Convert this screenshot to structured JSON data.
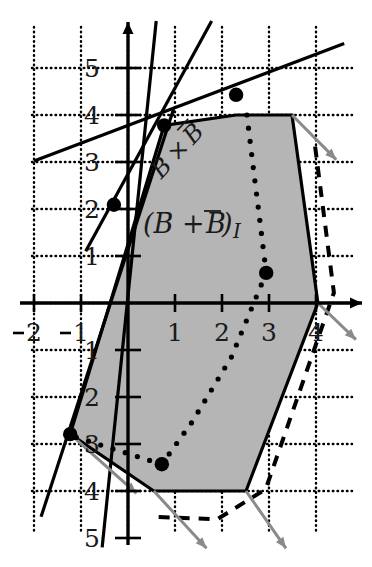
{
  "figure": {
    "title_label": "(B + B̅)₁",
    "region_label_main": "(B + ",
    "region_label_bar": "B",
    "region_label_close": ")",
    "region_label_sub": "I",
    "minkowski_label": "B × B",
    "minkowski_label_parts": {
      "b1": "B",
      "times": "×",
      "b2": "B"
    },
    "colors": {
      "shaded_region": "#b5b5b5",
      "outline": "#000000",
      "grid_dotted": "#000000",
      "axis": "#000000",
      "gray_arrow": "#8a8a8a",
      "dot": "#000000",
      "background": "#ffffff"
    }
  },
  "axes": {
    "x_label_values": [
      "2",
      "1",
      "1",
      "2",
      "3",
      "4"
    ],
    "y_label_values": [
      "5",
      "4",
      "3",
      "2",
      "1",
      "1",
      "2",
      "3",
      "4",
      "5"
    ],
    "x_ticks_negative": [
      "-2",
      "-1"
    ],
    "x_ticks_positive": [
      "1",
      "2",
      "3",
      "4"
    ],
    "y_ticks_positive": [
      "1",
      "2",
      "3",
      "4",
      "5"
    ],
    "y_ticks_negative": [
      "-1",
      "-2",
      "-3",
      "-4",
      "-5"
    ],
    "unit_px": 47,
    "origin_px": {
      "x": 128,
      "y": 303
    }
  },
  "chart_data": {
    "type": "scatter",
    "xlabel": "",
    "ylabel": "",
    "xlim": [
      -2.5,
      5.0
    ],
    "ylim": [
      -5.5,
      6.0
    ],
    "grid": true,
    "grid_spacing": 1,
    "legend": "none",
    "annotations": [
      {
        "text": "(B + B̅)₁",
        "x": 0.45,
        "y": 1.55,
        "role": "region-label"
      },
      {
        "text": "B × B",
        "x": 1.05,
        "y": 3.35,
        "role": "diagonal-label",
        "rotation": -46
      }
    ],
    "series": [
      {
        "name": "lattice-points",
        "type": "scatter",
        "marker": "filled-circle",
        "points": [
          {
            "x": 2.3,
            "y": 4.43
          },
          {
            "x": 0.77,
            "y": 3.78
          },
          {
            "x": -0.3,
            "y": 2.09
          },
          {
            "x": 2.94,
            "y": 0.64
          },
          {
            "x": -1.23,
            "y": -2.79
          },
          {
            "x": 0.72,
            "y": -3.43
          }
        ]
      },
      {
        "name": "shaded-polygon",
        "type": "polygon",
        "fill": "#b5b5b5",
        "stroke": "#000000",
        "vertices": [
          {
            "x": 0.77,
            "y": 3.78
          },
          {
            "x": 2.3,
            "y": 4.0
          },
          {
            "x": 3.49,
            "y": 4.0
          },
          {
            "x": 4.04,
            "y": 0.0
          },
          {
            "x": 2.51,
            "y": -4.0
          },
          {
            "x": 0.55,
            "y": -4.0
          },
          {
            "x": -1.23,
            "y": -2.79
          }
        ]
      },
      {
        "name": "dotted-interior-curve",
        "type": "dotted-path",
        "points": [
          {
            "x": 2.53,
            "y": 4.0
          },
          {
            "x": 2.94,
            "y": 0.64
          },
          {
            "x": 2.2,
            "y": -1.15
          },
          {
            "x": 1.35,
            "y": -2.55
          },
          {
            "x": 0.72,
            "y": -3.43
          },
          {
            "x": -1.1,
            "y": -2.86
          }
        ]
      },
      {
        "name": "support-lines",
        "type": "line-set",
        "lines": [
          {
            "from": {
              "x": -0.9,
              "y": 1.1
            },
            "to": {
              "x": 1.78,
              "y": 6.0
            }
          },
          {
            "from": {
              "x": -0.55,
              "y": -5.2
            },
            "to": {
              "x": 0.6,
              "y": 6.0
            }
          },
          {
            "from": {
              "x": -2.0,
              "y": 3.02
            },
            "to": {
              "x": 4.6,
              "y": 5.52
            }
          },
          {
            "from": {
              "x": -1.85,
              "y": -4.55
            },
            "to": {
              "x": 0.97,
              "y": 4.13
            }
          }
        ]
      },
      {
        "name": "gray-normal-arrows",
        "type": "arrow-set",
        "color": "#8a8a8a",
        "arrows": [
          {
            "from": {
              "x": 3.49,
              "y": 4.0
            },
            "to": {
              "x": 4.43,
              "y": 3.05
            }
          },
          {
            "from": {
              "x": 4.04,
              "y": 0.0
            },
            "to": {
              "x": 4.85,
              "y": -0.78
            }
          },
          {
            "from": {
              "x": 2.51,
              "y": -4.0
            },
            "to": {
              "x": 3.36,
              "y": -5.22
            }
          },
          {
            "from": {
              "x": 0.55,
              "y": -4.0
            },
            "to": {
              "x": 1.67,
              "y": -5.22
            }
          },
          {
            "from": {
              "x": -1.23,
              "y": -2.79
            },
            "to": {
              "x": 0.18,
              "y": -4.05
            }
          }
        ]
      },
      {
        "name": "dashed-offset-boundary",
        "type": "dashed-path",
        "points": [
          {
            "x": 3.98,
            "y": 3.33
          },
          {
            "x": 4.38,
            "y": 0.22
          },
          {
            "x": 2.93,
            "y": -3.96
          },
          {
            "x": 1.9,
            "y": -4.6
          },
          {
            "x": 0.6,
            "y": -4.55
          }
        ]
      }
    ]
  }
}
